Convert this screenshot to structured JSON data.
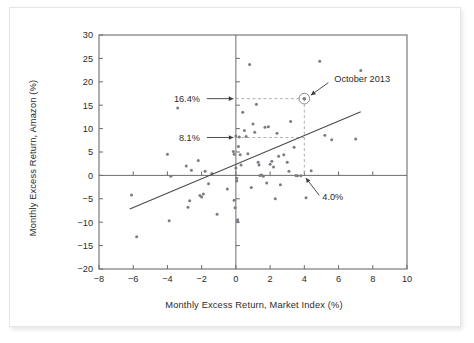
{
  "figure": {
    "background_color": "#ffffff",
    "frame_border_color": "#e6e6e6",
    "axis_color": "#6d6d6d",
    "point_color": "#7b7b84",
    "regression_line_color": "#4a4a4a",
    "dashed_guide_color": "#a8a8a8"
  },
  "chart_data": {
    "type": "scatter",
    "title": "",
    "xlabel": "Monthly Excess Return, Market Index (%)",
    "ylabel": "Monthly Excess Return, Amazon (%)",
    "xlim": [
      -8,
      10
    ],
    "ylim": [
      -20,
      30
    ],
    "xticks": [
      -8,
      -6,
      -4,
      -2,
      0,
      2,
      4,
      6,
      8,
      10
    ],
    "xtick_labels": [
      "-8",
      "-6",
      "-4",
      "-2",
      "0",
      "2",
      "4",
      "6",
      "8",
      "10"
    ],
    "yticks": [
      -20,
      -15,
      -10,
      -5,
      0,
      5,
      10,
      15,
      20,
      25,
      30
    ],
    "ytick_labels": [
      "-20",
      "-15",
      "-10",
      "-5",
      "0",
      "5",
      "10",
      "15",
      "20",
      "25",
      "30"
    ],
    "grid": false,
    "legend": null,
    "zero_lines": {
      "x": 0,
      "y": 0
    },
    "points": [
      [
        -6.1,
        -4.2
      ],
      [
        -5.8,
        -13.1
      ],
      [
        -4.0,
        4.5
      ],
      [
        -3.9,
        -9.7
      ],
      [
        -3.8,
        -0.2
      ],
      [
        -3.4,
        14.4
      ],
      [
        -2.9,
        2.0
      ],
      [
        -2.8,
        -6.8
      ],
      [
        -2.7,
        -5.4
      ],
      [
        -2.6,
        1.1
      ],
      [
        -2.2,
        3.2
      ],
      [
        -2.1,
        -4.3
      ],
      [
        -2.0,
        -4.6
      ],
      [
        -1.9,
        -4.0
      ],
      [
        -1.8,
        0.9
      ],
      [
        -1.6,
        -1.8
      ],
      [
        -1.4,
        0.4
      ],
      [
        -1.1,
        -8.3
      ],
      [
        -0.5,
        -2.9
      ],
      [
        -0.15,
        5.1
      ],
      [
        -0.1,
        4.5
      ],
      [
        -0.1,
        -5.3
      ],
      [
        -0.05,
        -6.9
      ],
      [
        0.0,
        8.4
      ],
      [
        0.0,
        1.6
      ],
      [
        0.05,
        -0.6
      ],
      [
        0.05,
        -1.2
      ],
      [
        0.1,
        -9.5
      ],
      [
        0.1,
        -9.9
      ],
      [
        0.15,
        6.2
      ],
      [
        0.2,
        8.2
      ],
      [
        0.25,
        4.4
      ],
      [
        0.3,
        2.2
      ],
      [
        0.4,
        13.5
      ],
      [
        0.5,
        9.6
      ],
      [
        0.6,
        8.3
      ],
      [
        0.7,
        4.6
      ],
      [
        0.8,
        23.7
      ],
      [
        0.9,
        -2.6
      ],
      [
        1.0,
        11.0
      ],
      [
        1.1,
        9.2
      ],
      [
        1.2,
        15.2
      ],
      [
        1.3,
        2.8
      ],
      [
        1.35,
        2.2
      ],
      [
        1.4,
        0.0
      ],
      [
        1.5,
        0.1
      ],
      [
        1.6,
        -0.2
      ],
      [
        1.7,
        10.3
      ],
      [
        1.8,
        -1.6
      ],
      [
        1.9,
        10.4
      ],
      [
        2.0,
        2.4
      ],
      [
        2.1,
        3.0
      ],
      [
        2.2,
        1.8
      ],
      [
        2.3,
        -5.0
      ],
      [
        2.4,
        9.0
      ],
      [
        2.5,
        4.1
      ],
      [
        2.6,
        -2.0
      ],
      [
        2.8,
        4.4
      ],
      [
        3.0,
        2.8
      ],
      [
        3.1,
        0.9
      ],
      [
        3.2,
        11.5
      ],
      [
        3.4,
        6.0
      ],
      [
        3.5,
        0.0
      ],
      [
        3.6,
        -0.1
      ],
      [
        3.8,
        -0.1
      ],
      [
        4.0,
        16.4
      ],
      [
        4.1,
        -4.8
      ],
      [
        4.4,
        1.0
      ],
      [
        4.9,
        24.4
      ],
      [
        5.2,
        8.6
      ],
      [
        5.6,
        7.6
      ],
      [
        7.0,
        7.8
      ],
      [
        7.3,
        22.4
      ]
    ],
    "regression_line": {
      "x": [
        -6.2,
        7.3
      ],
      "y": [
        -7.2,
        13.6
      ]
    },
    "highlight_point": {
      "label": "October 2013",
      "x": 4.0,
      "y": 16.4
    },
    "annotations": [
      {
        "text": "16.4%",
        "value": 16.4,
        "axis": "y",
        "points_to": [
          0.0,
          16.4
        ]
      },
      {
        "text": "8.1%",
        "value": 8.1,
        "axis": "y",
        "points_to": [
          0.0,
          8.1
        ]
      },
      {
        "text": "4.0%",
        "value": 4.0,
        "axis": "x",
        "points_to": [
          4.0,
          0.0
        ]
      },
      {
        "text": "October 2013",
        "points_to": [
          4.0,
          16.4
        ]
      }
    ],
    "guides": [
      {
        "from": [
          0.0,
          16.4
        ],
        "to": [
          4.0,
          16.4
        ],
        "style": "dashed"
      },
      {
        "from": [
          0.0,
          8.1
        ],
        "to": [
          4.0,
          8.1
        ],
        "style": "dashed"
      },
      {
        "from": [
          4.0,
          16.4
        ],
        "to": [
          4.0,
          0.0
        ],
        "style": "dashed"
      }
    ]
  }
}
